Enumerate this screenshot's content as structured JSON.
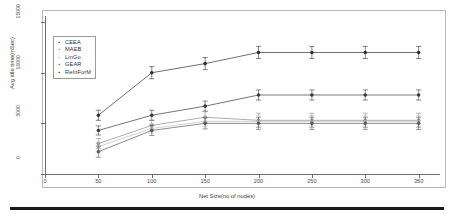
{
  "figure": {
    "background": "#ffffff",
    "panel_border_color": "#b9b9b9",
    "axis_color": "#6e6e6e",
    "bottom_rule_color": "#1a1a1a"
  },
  "axes": {
    "x_title": "Net Size(no of nodes)",
    "y_title": "Avg idle time(mSec)",
    "x_ticks": [
      "0",
      "50",
      "100",
      "150",
      "200",
      "250",
      "300",
      "350"
    ],
    "y_ticks": [
      "0",
      "5000",
      "10000",
      "15000"
    ]
  },
  "legend": {
    "entries": [
      {
        "label": "CEEA",
        "marker": "square",
        "color": "#3a3a3a"
      },
      {
        "label": "MAEB",
        "marker": "square",
        "color": "#8a8a8a"
      },
      {
        "label": "LinGo",
        "marker": "square",
        "color": "#bdbdbd"
      },
      {
        "label": "GEAR",
        "marker": "square",
        "color": "#5a5a5a"
      },
      {
        "label": "ReInForM",
        "marker": "square",
        "color": "#303030"
      }
    ]
  },
  "chart_data": {
    "type": "line",
    "title": "",
    "xlabel": "Net Size(no of nodes)",
    "ylabel": "Avg idle time(mSec)",
    "xlim": [
      0,
      370
    ],
    "ylim": [
      0,
      15600
    ],
    "grid": false,
    "legend_position": "upper-left-inside",
    "error_bars": true,
    "x": [
      50,
      100,
      150,
      200,
      250,
      300,
      350
    ],
    "series": [
      {
        "name": "ReInForM",
        "color": "#303030",
        "values": [
          5800,
          10000,
          10900,
          12000,
          12000,
          12000,
          12000
        ],
        "errors": [
          500,
          600,
          600,
          600,
          600,
          600,
          600
        ]
      },
      {
        "name": "CEEA",
        "color": "#3a3a3a",
        "values": [
          4300,
          5800,
          6700,
          7800,
          7800,
          7800,
          7800
        ],
        "errors": [
          450,
          500,
          500,
          500,
          500,
          500,
          500
        ]
      },
      {
        "name": "MAEB",
        "color": "#8a8a8a",
        "values": [
          3000,
          4800,
          5600,
          5300,
          5300,
          5300,
          5300
        ],
        "errors": [
          500,
          500,
          550,
          700,
          700,
          700,
          700
        ]
      },
      {
        "name": "LinGo",
        "color": "#bdbdbd",
        "values": [
          2700,
          4500,
          5200,
          5200,
          5200,
          5200,
          5200
        ],
        "errors": [
          450,
          450,
          500,
          550,
          550,
          550,
          550
        ]
      },
      {
        "name": "GEAR",
        "color": "#5a5a5a",
        "values": [
          2200,
          4300,
          5000,
          5000,
          5000,
          5000,
          5000
        ],
        "errors": [
          550,
          500,
          550,
          600,
          600,
          600,
          600
        ]
      }
    ]
  }
}
